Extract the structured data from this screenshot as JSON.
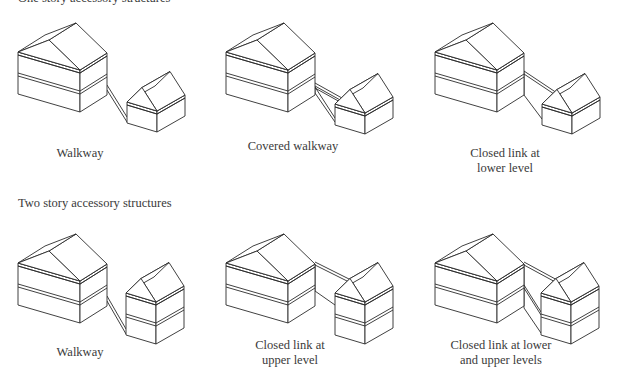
{
  "sections": [
    {
      "heading": "One story accessory structures",
      "heading_pos": [
        18,
        -9
      ],
      "panels": [
        {
          "label_lines": [
            "Walkway"
          ],
          "label_pos": [
            80,
            146
          ],
          "main": {
            "x": 18,
            "y": 52,
            "stories": 2
          },
          "accessory": {
            "x": 127,
            "y": 102,
            "stories": 1
          },
          "link": "walkway"
        },
        {
          "label_lines": [
            "Covered walkway"
          ],
          "label_pos": [
            293,
            139
          ],
          "main": {
            "x": 226,
            "y": 52,
            "stories": 2
          },
          "accessory": {
            "x": 335,
            "y": 104,
            "stories": 1
          },
          "link": "covered_walkway"
        },
        {
          "label_lines": [
            "Closed link at",
            "lower level"
          ],
          "label_pos": [
            505,
            146
          ],
          "main": {
            "x": 435,
            "y": 52,
            "stories": 2
          },
          "accessory": {
            "x": 542,
            "y": 104,
            "stories": 1
          },
          "link": "closed_lower"
        }
      ]
    },
    {
      "heading": "Two story accessory structures",
      "heading_pos": [
        18,
        196
      ],
      "panels": [
        {
          "label_lines": [
            "Walkway"
          ],
          "label_pos": [
            80,
            345
          ],
          "main": {
            "x": 18,
            "y": 263,
            "stories": 2
          },
          "accessory": {
            "x": 126,
            "y": 293,
            "stories": 2
          },
          "link": "walkway"
        },
        {
          "label_lines": [
            "Closed link at",
            "upper level"
          ],
          "label_pos": [
            290,
            338
          ],
          "main": {
            "x": 226,
            "y": 263,
            "stories": 2
          },
          "accessory": {
            "x": 335,
            "y": 293,
            "stories": 2
          },
          "link": "closed_upper"
        },
        {
          "label_lines": [
            "Closed link at lower",
            "and upper levels"
          ],
          "label_pos": [
            501,
            338
          ],
          "main": {
            "x": 435,
            "y": 263,
            "stories": 2
          },
          "accessory": {
            "x": 541,
            "y": 293,
            "stories": 2
          },
          "link": "closed_both"
        }
      ]
    }
  ],
  "style": {
    "line_color": "#2b2b2b",
    "text_color": "#3a3a3a",
    "background": "#ffffff"
  },
  "geometry": {
    "main": {
      "a": [
        62,
        18
      ],
      "b": [
        27,
        -17
      ],
      "story": 21,
      "roof": 21
    },
    "accessory": {
      "a": [
        30,
        9
      ],
      "b": [
        28,
        -16
      ],
      "story": 21,
      "roof": 19
    }
  }
}
